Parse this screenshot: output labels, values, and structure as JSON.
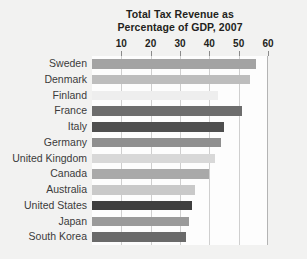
{
  "chart_data": {
    "type": "bar",
    "orientation": "horizontal",
    "title": "Total Tax Revenue as Percentage of GDP, 2007",
    "title_line1": "Total Tax Revenue as",
    "title_line2": "Percentage of GDP, 2007",
    "xlabel": "",
    "ylabel": "",
    "xlim": [
      0,
      60
    ],
    "ticks": [
      10,
      20,
      30,
      40,
      50,
      60
    ],
    "tick_labels": [
      "10",
      "20",
      "30",
      "40",
      "50",
      "60"
    ],
    "grid": true,
    "grid_axis": "x",
    "legend": false,
    "axis_position": "top",
    "categories": [
      "Sweden",
      "Denmark",
      "Finland",
      "France",
      "Italy",
      "Germany",
      "United Kingdom",
      "Canada",
      "Australia",
      "United States",
      "Japan",
      "South Korea"
    ],
    "values": [
      56,
      54,
      43,
      51,
      45,
      44,
      42,
      40,
      35,
      34,
      33,
      32
    ],
    "bar_colors": [
      "#a3a3a3",
      "#bdbdbd",
      "#eeeeee",
      "#6d6d6d",
      "#4f4f4f",
      "#8f8f8f",
      "#d8d8d8",
      "#a9a9a9",
      "#c9c9c9",
      "#3f3f3f",
      "#9a9a9a",
      "#6a6a6a"
    ]
  },
  "colors": {
    "page_background": "#f2f2f1",
    "plot_background": "#fdfdfd",
    "gridline": "#cfcfcf",
    "axis_border": "#b4b4b4",
    "title_text": "#231f20",
    "label_text": "#3b3b3b",
    "tick_text": "#231f20"
  }
}
